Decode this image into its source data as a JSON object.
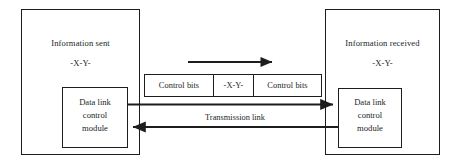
{
  "diagram": {
    "stroke_color": "#1d1d1d",
    "text_color": "#201f1f",
    "background": "#ffffff",
    "sender": {
      "title": "Information sent",
      "payload": "-X-Y-",
      "module": {
        "line1": "Data link",
        "line2": "control",
        "line3": "module"
      }
    },
    "receiver": {
      "title": "Information received",
      "payload": "-X-Y-",
      "module": {
        "line1": "Data link",
        "line2": "control",
        "line3": "module"
      }
    },
    "frame": {
      "segments": [
        {
          "label": "Control bits"
        },
        {
          "label": "-X-Y-"
        },
        {
          "label": "Control bits"
        }
      ]
    },
    "links": {
      "transmission_label": "Transmission link",
      "flow_arrow": "right-arrow",
      "forward_arrow": "right-arrow",
      "return_arrow": "left-arrow"
    }
  }
}
